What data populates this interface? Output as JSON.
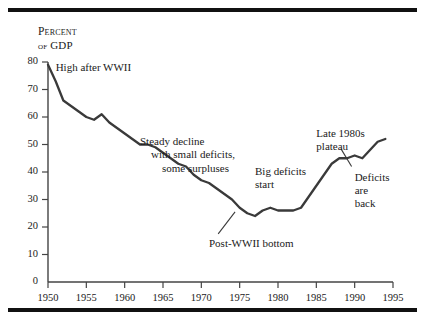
{
  "figure": {
    "rules": {
      "top_label": "top-rule",
      "bottom_label": "bottom-rule"
    },
    "axis_title_line1": "Percent",
    "axis_title_of": "of",
    "axis_title_line2": "GDP"
  },
  "chart_data": {
    "type": "line",
    "title": "",
    "subtitle": "",
    "xlabel": "",
    "ylabel": "Percent of GDP",
    "xlim": [
      1950,
      1995
    ],
    "ylim": [
      0,
      80
    ],
    "grid": false,
    "legend": "none",
    "series_name": "Federal debt as percent of GDP",
    "line_color": "#3a3a3a",
    "x_ticks": [
      1950,
      1955,
      1960,
      1965,
      1970,
      1975,
      1980,
      1985,
      1990,
      1995
    ],
    "x_tick_labels": [
      "1950",
      "1955",
      "1960",
      "1965",
      "1970",
      "1975",
      "1980",
      "1985",
      "1990",
      "1995"
    ],
    "y_ticks": [
      10,
      20,
      30,
      40,
      50,
      60,
      70,
      80
    ],
    "y_tick_labels": [
      "10",
      "20",
      "30",
      "40",
      "50",
      "60",
      "70",
      "80"
    ],
    "origin_label": "0",
    "x": [
      1950,
      1951,
      1952,
      1953,
      1954,
      1955,
      1956,
      1957,
      1958,
      1959,
      1960,
      1961,
      1962,
      1963,
      1964,
      1965,
      1966,
      1967,
      1968,
      1969,
      1970,
      1971,
      1972,
      1973,
      1974,
      1975,
      1976,
      1977,
      1978,
      1979,
      1980,
      1981,
      1982,
      1983,
      1984,
      1985,
      1986,
      1987,
      1988,
      1989,
      1990,
      1991,
      1992,
      1993,
      1994
    ],
    "values": [
      79,
      73,
      66,
      64,
      62,
      60,
      59,
      61,
      58,
      56,
      54,
      52,
      50,
      50,
      49,
      47,
      45,
      43,
      42,
      39,
      37,
      36,
      34,
      32,
      30,
      27,
      25,
      24,
      26,
      27,
      26,
      26,
      26,
      27,
      31,
      35,
      39,
      43,
      45,
      45,
      46,
      45,
      48,
      51,
      52
    ],
    "annotations": [
      {
        "id": "high-after-wwii",
        "text": "High after WWII",
        "x": 1951,
        "y": 78,
        "leader": false
      },
      {
        "id": "steady-decline",
        "text_lines": [
          "Steady decline",
          "with small deficits,",
          "some surpluses"
        ],
        "x": 1962,
        "y": 51,
        "leader": false
      },
      {
        "id": "post-wwii-bottom",
        "text": "Post-WWII bottom",
        "x": 1971,
        "y": 14,
        "leader": true
      },
      {
        "id": "big-deficits-start",
        "text_lines": [
          "Big deficits",
          "start"
        ],
        "x": 1977,
        "y": 40,
        "leader": false
      },
      {
        "id": "late-1980s-plateau",
        "text_lines": [
          "Late 1980s",
          "plateau"
        ],
        "x": 1985,
        "y": 54,
        "leader": false
      },
      {
        "id": "deficits-are-back",
        "text_lines": [
          "Deficits",
          "are",
          "back"
        ],
        "x": 1990,
        "y": 38,
        "leader": true
      }
    ]
  }
}
